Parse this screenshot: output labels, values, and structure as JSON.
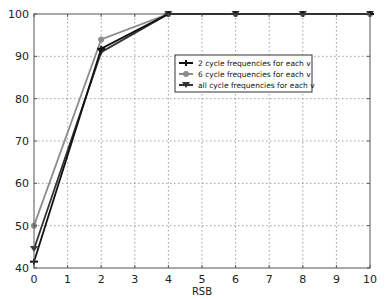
{
  "chart_data": {
    "type": "line",
    "title": "",
    "xlabel": "RSB",
    "ylabel": "",
    "xlim": [
      0,
      10
    ],
    "ylim": [
      40,
      100
    ],
    "xticks": [
      0,
      1,
      2,
      3,
      4,
      5,
      6,
      7,
      8,
      9,
      10
    ],
    "yticks": [
      40,
      50,
      60,
      70,
      80,
      90,
      100
    ],
    "grid": true,
    "legend_position": "upper right (inside)",
    "series": [
      {
        "name": "2 cycle frequencies for each v",
        "color": "#111111",
        "marker": "plus",
        "x": [
          0,
          2,
          4,
          6,
          8,
          10
        ],
        "y": [
          41.5,
          91.8,
          100,
          100,
          100,
          100
        ]
      },
      {
        "name": "6 cycle frequencies for each v",
        "color": "#8c8c8c",
        "marker": "circle",
        "x": [
          0,
          2,
          4,
          6,
          8,
          10
        ],
        "y": [
          50,
          94,
          100,
          100,
          100,
          100
        ]
      },
      {
        "name": "all cycle frequencies for each v",
        "color": "#333333",
        "marker": "triangle-down",
        "x": [
          0,
          2,
          4,
          6,
          8,
          10
        ],
        "y": [
          44.5,
          91,
          100,
          100,
          100,
          100
        ]
      }
    ]
  },
  "labels": {
    "xlabel": "RSB",
    "legend": [
      "2 cycle frequencies for each v",
      "6 cycle frequencies for each v",
      "all cycle frequencies for each v"
    ]
  }
}
